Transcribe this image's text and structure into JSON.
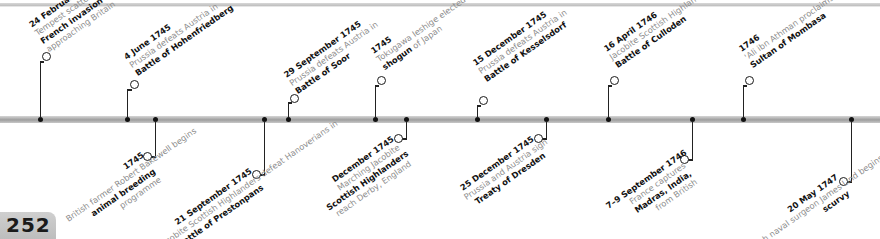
{
  "page": {
    "number": "252"
  },
  "timeline": {
    "accent_color": "#111111",
    "text_color": "#8a8a8a",
    "bar_color": "#b0b0b0",
    "above": [
      {
        "date": "24 February 1744",
        "pre": "Tempest scatters",
        "bold": "French invasion fleet",
        "post": "approaching Britain"
      },
      {
        "date": "4 June 1745",
        "pre": "Prussia defeats Austria in",
        "bold": "Battle of Hohenfriedberg",
        "post": ""
      },
      {
        "date": "29 September 1745",
        "pre": "Prussia defeats Austria in",
        "bold": "Battle of Soor",
        "post": ""
      },
      {
        "date": "1745",
        "pre": "Tokugawa Ieshige elected",
        "bold": "shogun",
        "post": "of Japan"
      },
      {
        "date": "15 December 1745",
        "pre": "Prussia defeats Austria in",
        "bold": "Battle of Kesselsdorf",
        "post": ""
      },
      {
        "date": "16 April 1746",
        "pre": "Jacobite Scottish Highlanders massacred at",
        "bold": "Battle of Culloden",
        "post": ""
      },
      {
        "date": "1746",
        "pre": "'Ali ibn Athman proclaims himself",
        "bold": "Sultan of Mombasa",
        "post": ""
      }
    ],
    "below": [
      {
        "date": "1745",
        "pre": "British farmer Robert Bakewell begins",
        "bold": "animal breeding",
        "post": "programme"
      },
      {
        "date": "21 September 1745",
        "pre": "Jacobite Scottish Highlanders defeat Hanoverians in",
        "bold": "Battle of Prestonpans",
        "post": ""
      },
      {
        "date": "December 1745",
        "pre": "Marching Jacobite",
        "bold": "Scottish Highlanders",
        "post": "reach Derby, England"
      },
      {
        "date": "25 December 1745",
        "pre": "Prussia and Austria sign",
        "bold": "Treaty of Dresden",
        "post": ""
      },
      {
        "date": "7–9 September 1746",
        "pre": "France captures",
        "bold": "Madras, India,",
        "post": "from British"
      },
      {
        "date": "20 May 1747",
        "pre": "British naval surgeon James Lind begins experiments to discover cause of",
        "bold": "scurvy",
        "post": ""
      }
    ]
  }
}
